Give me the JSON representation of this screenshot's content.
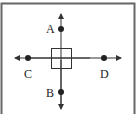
{
  "diagram": {
    "colors": {
      "line": "#333333",
      "frame": "#666666",
      "background": "#ffffff"
    },
    "center_square": {
      "label": ""
    },
    "points": [
      {
        "id": "A",
        "label": "A",
        "position": "above square on vertical axis"
      },
      {
        "id": "B",
        "label": "B",
        "position": "below square on vertical axis"
      },
      {
        "id": "C",
        "label": "C",
        "position": "left of square on horizontal axis"
      },
      {
        "id": "D",
        "label": "D",
        "position": "right of square on horizontal axis"
      }
    ]
  }
}
